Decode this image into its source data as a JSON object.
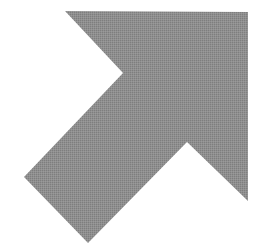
{
  "image": {
    "description": "Gray arrow pointing up and to the right",
    "icon": "arrow-up-right-icon",
    "background_color": "#ffffff",
    "fill_color": "#8c8c8c",
    "fill_texture": "dithered",
    "width": 267,
    "height": 252
  },
  "arrow": {
    "direction": "up-right",
    "points": [
      [
        65,
        11
      ],
      [
        248,
        12
      ],
      [
        248,
        201
      ],
      [
        187,
        142
      ],
      [
        88,
        243
      ],
      [
        24,
        177
      ],
      [
        123,
        73
      ]
    ]
  }
}
